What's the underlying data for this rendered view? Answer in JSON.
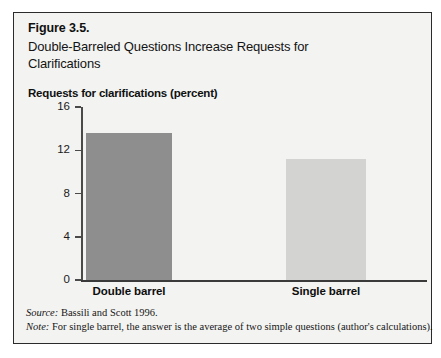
{
  "figure": {
    "number": "Figure 3.5.",
    "title": "Double-Barreled Questions Increase Requests for Clarifications",
    "axis_title": "Requests for clarifications (percent)",
    "source_label": "Source:",
    "source_text": " Bassili and Scott 1996.",
    "note_label": "Note:",
    "note_text": " For single barrel, the answer is the average of two simple questions (author's calculations).",
    "border_color": "#2b2b2b",
    "background_color": "#f3f3f1"
  },
  "chart_data": {
    "type": "bar",
    "title": "Double-Barreled Questions Increase Requests for Clarifications",
    "xlabel": "",
    "ylabel": "Requests for clarifications (percent)",
    "categories": [
      "Double barrel",
      "Single barrel"
    ],
    "values": [
      13.6,
      11.2
    ],
    "ylim": [
      0,
      16
    ],
    "yticks": [
      0,
      4,
      8,
      12,
      16
    ],
    "ytick_labels": [
      "0",
      "4",
      "8",
      "12",
      "16"
    ],
    "grid": false,
    "legend": "none",
    "bar_colors": [
      "#8e8e8e",
      "#d3d3d1"
    ]
  }
}
